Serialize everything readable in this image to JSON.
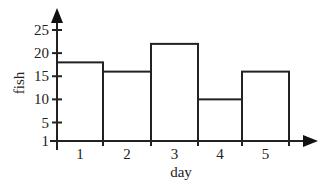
{
  "chart_data": {
    "type": "bar",
    "title": "",
    "xlabel": "day",
    "ylabel": "fish",
    "categories": [
      "1",
      "2",
      "3",
      "4",
      "5"
    ],
    "values": [
      18,
      16,
      22,
      10,
      16
    ],
    "yticks": [
      1,
      5,
      10,
      15,
      20,
      25
    ],
    "ylim": [
      1,
      27
    ],
    "grid": false,
    "legend": null,
    "bar_style": "histogram, adjacent unfilled bars with black outline"
  },
  "axes": {
    "x_label": "day",
    "y_label": "fish",
    "y_tick_labels": [
      "25",
      "20",
      "15",
      "10",
      "5",
      "1"
    ],
    "x_tick_labels": [
      "1",
      "2",
      "3",
      "4",
      "5"
    ]
  },
  "colors": {
    "line": "#222222",
    "background": "#ffffff"
  }
}
